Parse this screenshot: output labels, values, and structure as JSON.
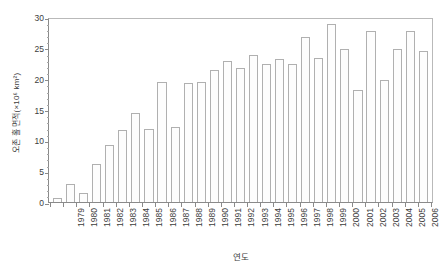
{
  "chart_data": {
    "type": "bar",
    "title": "",
    "subtitle": "",
    "xlabel": "연도",
    "ylabel": "오존 홀 면적(×10⁶ km²)",
    "ylim": [
      0,
      30
    ],
    "yticks": [
      0,
      5,
      10,
      15,
      20,
      25,
      30
    ],
    "ytick_labels": [
      "0",
      "5",
      "10",
      "15",
      "20",
      "25",
      "30"
    ],
    "y_minor_step": 1,
    "grid": false,
    "legend": null,
    "bar_style": {
      "fill": "#fdfdfd",
      "edge": "#b0b0b0"
    },
    "axis_color": "#8a8a8a",
    "categories": [
      "1979",
      "1980",
      "1981",
      "1982",
      "1983",
      "1984",
      "1985",
      "1986",
      "1987",
      "1988",
      "1989",
      "1990",
      "1991",
      "1992",
      "1993",
      "1994",
      "1995",
      "1996",
      "1997",
      "1998",
      "1999",
      "2000",
      "2001",
      "2002",
      "2003",
      "2004",
      "2005",
      "2006",
      "2007"
    ],
    "values": [
      0.6,
      3.0,
      1.4,
      6.1,
      9.3,
      11.6,
      14.5,
      11.9,
      19.5,
      12.1,
      19.3,
      19.4,
      21.4,
      22.8,
      21.7,
      23.9,
      22.3,
      23.2,
      22.3,
      26.7,
      23.3,
      28.8,
      24.8,
      18.2,
      27.8,
      19.8,
      24.8,
      27.7,
      24.5
    ],
    "units": "×10⁶ km²"
  }
}
